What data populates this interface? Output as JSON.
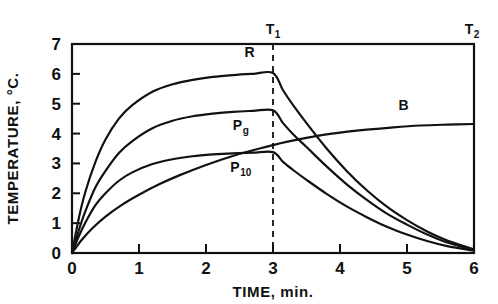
{
  "chart_data": {
    "type": "line",
    "title": "",
    "xlabel": "TIME, min.",
    "ylabel": "TEMPERATURE, °C.",
    "xlim": [
      0,
      6
    ],
    "ylim": [
      0,
      7
    ],
    "xticks": [
      "0",
      "1",
      "2",
      "3",
      "4",
      "5",
      "6"
    ],
    "yticks": [
      "0",
      "1",
      "2",
      "3",
      "4",
      "5",
      "6",
      "7"
    ],
    "grid": false,
    "legend_position": "inline-labels",
    "annotations": [
      {
        "name": "T1",
        "text": "T",
        "subscript": "1",
        "x": 3.0,
        "note": "dashed vertical line at t = 3 min"
      },
      {
        "name": "T2",
        "text": "T",
        "subscript": "2",
        "x": 6.0,
        "note": "right edge of plot"
      }
    ],
    "series": [
      {
        "name": "R",
        "label": "R",
        "subscript": "",
        "label_x": 2.65,
        "label_y": 6.55,
        "peak_value": 6.03,
        "peak_time": 3.0,
        "end_value": 0.12,
        "x": [
          0,
          0.1,
          0.2,
          0.35,
          0.5,
          0.7,
          0.9,
          1.2,
          1.5,
          1.8,
          2.1,
          2.4,
          2.7,
          3.0,
          3.15,
          3.3,
          3.5,
          3.8,
          4.1,
          4.4,
          4.7,
          5.0,
          5.3,
          5.6,
          6.0
        ],
        "y": [
          0,
          1.15,
          2.05,
          3.05,
          3.8,
          4.5,
          4.95,
          5.4,
          5.65,
          5.8,
          5.9,
          5.96,
          6.0,
          6.03,
          5.45,
          4.95,
          4.35,
          3.5,
          2.75,
          2.1,
          1.55,
          1.1,
          0.72,
          0.42,
          0.12
        ]
      },
      {
        "name": "Pg",
        "label": "P",
        "subscript": "g",
        "label_x": 2.52,
        "label_y": 4.12,
        "peak_value": 4.78,
        "peak_time": 3.0,
        "end_value": 0.1,
        "x": [
          0,
          0.1,
          0.2,
          0.35,
          0.5,
          0.7,
          0.9,
          1.2,
          1.5,
          1.8,
          2.1,
          2.4,
          2.7,
          3.0,
          3.15,
          3.3,
          3.5,
          3.8,
          4.1,
          4.4,
          4.7,
          5.0,
          5.3,
          5.6,
          6.0
        ],
        "y": [
          0,
          0.75,
          1.4,
          2.2,
          2.75,
          3.35,
          3.75,
          4.18,
          4.43,
          4.58,
          4.67,
          4.73,
          4.76,
          4.78,
          4.35,
          3.98,
          3.55,
          2.9,
          2.3,
          1.78,
          1.32,
          0.95,
          0.62,
          0.35,
          0.1
        ]
      },
      {
        "name": "P10",
        "label": "P",
        "subscript": "10",
        "label_x": 2.52,
        "label_y": 2.72,
        "peak_value": 3.38,
        "peak_time": 3.0,
        "end_value": 0.08,
        "x": [
          0,
          0.1,
          0.2,
          0.35,
          0.5,
          0.7,
          0.9,
          1.2,
          1.5,
          1.8,
          2.1,
          2.4,
          2.7,
          3.0,
          3.15,
          3.3,
          3.5,
          3.8,
          4.1,
          4.4,
          4.7,
          5.0,
          5.3,
          5.6,
          6.0
        ],
        "y": [
          0,
          0.55,
          1.02,
          1.6,
          2.0,
          2.42,
          2.7,
          2.98,
          3.14,
          3.24,
          3.3,
          3.34,
          3.36,
          3.38,
          3.05,
          2.78,
          2.45,
          1.98,
          1.56,
          1.2,
          0.88,
          0.62,
          0.4,
          0.23,
          0.08
        ]
      },
      {
        "name": "B",
        "label": "B",
        "subscript": "",
        "label_x": 4.95,
        "label_y": 4.78,
        "peak_value": 4.32,
        "peak_time": 6.0,
        "end_value": 4.32,
        "x": [
          0,
          0.15,
          0.3,
          0.5,
          0.75,
          1.0,
          1.3,
          1.6,
          2.0,
          2.4,
          2.8,
          3.2,
          3.6,
          4.0,
          4.4,
          4.8,
          5.2,
          5.6,
          6.0
        ],
        "y": [
          0,
          0.45,
          0.82,
          1.22,
          1.62,
          1.95,
          2.3,
          2.6,
          2.95,
          3.25,
          3.5,
          3.72,
          3.9,
          4.03,
          4.13,
          4.21,
          4.27,
          4.3,
          4.32
        ]
      }
    ]
  }
}
